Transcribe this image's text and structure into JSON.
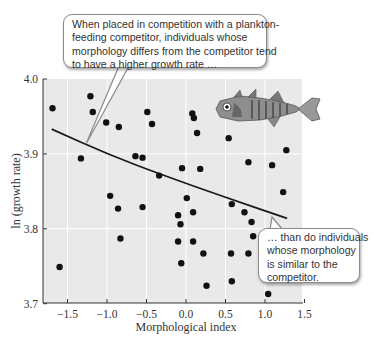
{
  "chart_data": {
    "type": "scatter",
    "title": "",
    "xlabel": "Morphological index",
    "ylabel": "ln (growth rate)",
    "xlim": [
      -1.75,
      1.5
    ],
    "ylim": [
      3.7,
      4.0
    ],
    "xticks": [
      "-1.5",
      "-1.0",
      "-0.5",
      "0.0",
      "0.5",
      "1.0",
      "1.5"
    ],
    "xtick_values": [
      -1.5,
      -1.0,
      -0.5,
      0.0,
      0.5,
      1.0,
      1.5
    ],
    "yticks": [
      "3.7",
      "3.8",
      "3.9",
      "4.0"
    ],
    "ytick_values": [
      3.7,
      3.8,
      3.9,
      4.0
    ],
    "grid": true,
    "points": [
      [
        -1.69,
        3.961
      ],
      [
        -1.21,
        3.977
      ],
      [
        -1.18,
        3.956
      ],
      [
        -1.01,
        3.942
      ],
      [
        -0.85,
        3.936
      ],
      [
        -1.33,
        3.894
      ],
      [
        -0.64,
        3.897
      ],
      [
        -0.55,
        3.895
      ],
      [
        -0.49,
        3.956
      ],
      [
        -0.43,
        3.94
      ],
      [
        0.08,
        3.954
      ],
      [
        0.1,
        3.948
      ],
      [
        0.14,
        3.928
      ],
      [
        0.54,
        3.921
      ],
      [
        -0.34,
        3.871
      ],
      [
        -0.05,
        3.881
      ],
      [
        0.18,
        3.88
      ],
      [
        0.79,
        3.889
      ],
      [
        1.09,
        3.885
      ],
      [
        1.27,
        3.905
      ],
      [
        1.23,
        3.849
      ],
      [
        0.58,
        3.833
      ],
      [
        0.74,
        3.822
      ],
      [
        0.83,
        3.809
      ],
      [
        0.85,
        3.79
      ],
      [
        -0.96,
        3.844
      ],
      [
        -0.86,
        3.827
      ],
      [
        -0.55,
        3.829
      ],
      [
        -0.83,
        3.787
      ],
      [
        -1.6,
        3.749
      ],
      [
        0.01,
        3.841
      ],
      [
        -0.1,
        3.818
      ],
      [
        0.09,
        3.822
      ],
      [
        -0.07,
        3.806
      ],
      [
        -0.1,
        3.783
      ],
      [
        0.09,
        3.783
      ],
      [
        0.22,
        3.767
      ],
      [
        -0.06,
        3.754
      ],
      [
        0.57,
        3.767
      ],
      [
        0.79,
        3.767
      ],
      [
        0.26,
        3.724
      ],
      [
        0.58,
        3.73
      ],
      [
        1.04,
        3.713
      ]
    ],
    "fit_line": {
      "type": "curve",
      "points": [
        [
          -1.7,
          3.933
        ],
        [
          -1.0,
          3.9
        ],
        [
          -0.33,
          3.873
        ],
        [
          0.5,
          3.842
        ],
        [
          1.28,
          3.814
        ]
      ]
    },
    "annotations": [
      {
        "id": "callout-top",
        "lines": [
          "When placed in competition with a plankton-",
          "feeding competitor, individuals whose",
          "morphology differs from the competitor tend",
          "to have a higher growth rate …"
        ]
      },
      {
        "id": "callout-bottom",
        "lines": [
          "… than do individuals",
          "whose morphology",
          "is similar to the",
          "competitor."
        ]
      }
    ],
    "illustration": "stickleback-fish"
  },
  "colors": {
    "plot_background": "#e9e9e9",
    "gridline": "#ffffff",
    "point": "#111111",
    "line": "#1a1a1a",
    "axis": "#333333"
  }
}
